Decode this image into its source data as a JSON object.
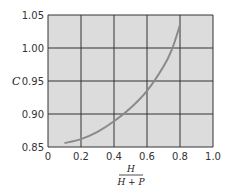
{
  "chart_data": {
    "type": "line",
    "title": "",
    "xlabel_numerator": "H",
    "xlabel_denominator": "H + P",
    "ylabel": "C",
    "xlim": [
      0,
      1.0
    ],
    "ylim": [
      0.85,
      1.05
    ],
    "grid": true,
    "x_ticks": [
      "0",
      "0.2",
      "0.4",
      "0.6",
      "0.8",
      "1.0"
    ],
    "y_ticks": [
      "0.85",
      "0.90",
      "0.95",
      "1.00",
      "1.05"
    ],
    "series": [
      {
        "name": "C",
        "x": [
          0.1,
          0.2,
          0.3,
          0.4,
          0.5,
          0.6,
          0.7,
          0.75,
          0.8
        ],
        "y": [
          0.856,
          0.862,
          0.873,
          0.889,
          0.909,
          0.935,
          0.972,
          0.997,
          1.035
        ]
      }
    ],
    "colors": {
      "plot_bg": "#dcdcdc",
      "grid": "#333333",
      "line": "#8a8a8a"
    }
  }
}
